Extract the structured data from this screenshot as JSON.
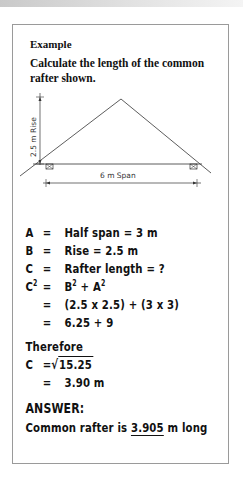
{
  "example": {
    "label": "Example",
    "task": "Calculate the length of the common rafter shown."
  },
  "diagram": {
    "rise_label": "2.5 m Rise",
    "span_label": "6 m Span",
    "rise_value_m": 2.5,
    "span_value_m": 6,
    "icons": [
      "wall-plate-left-icon",
      "wall-plate-right-icon",
      "arrow-icon"
    ]
  },
  "calc": {
    "lines": [
      {
        "sym": "A",
        "eq": "=",
        "expr": "Half span = 3 m"
      },
      {
        "sym": "B",
        "eq": "=",
        "expr": "Rise = 2.5 m"
      },
      {
        "sym": "C",
        "eq": "=",
        "expr": "Rafter length = ?"
      },
      {
        "sym": "C",
        "sup": "2",
        "eq": "=",
        "expr_b": "B",
        "expr_b_sup": "2",
        "expr_plus": " + A",
        "expr_a_sup": "2"
      },
      {
        "sym": "",
        "eq": "=",
        "expr": "(2.5 x 2.5) + (3 x 3)"
      },
      {
        "sym": "",
        "eq": "=",
        "expr": "6.25 + 9"
      }
    ],
    "therefore": "Therefore",
    "c_sym": "C",
    "c_eq": "=",
    "sqrt_symbol": "√",
    "radicand": "15.25",
    "result_eq": "=",
    "result": "3.90 m",
    "answer_heading": "ANSWER:",
    "answer_prefix": "Common rafter is ",
    "answer_value": "3.905",
    "answer_suffix": " m long"
  }
}
